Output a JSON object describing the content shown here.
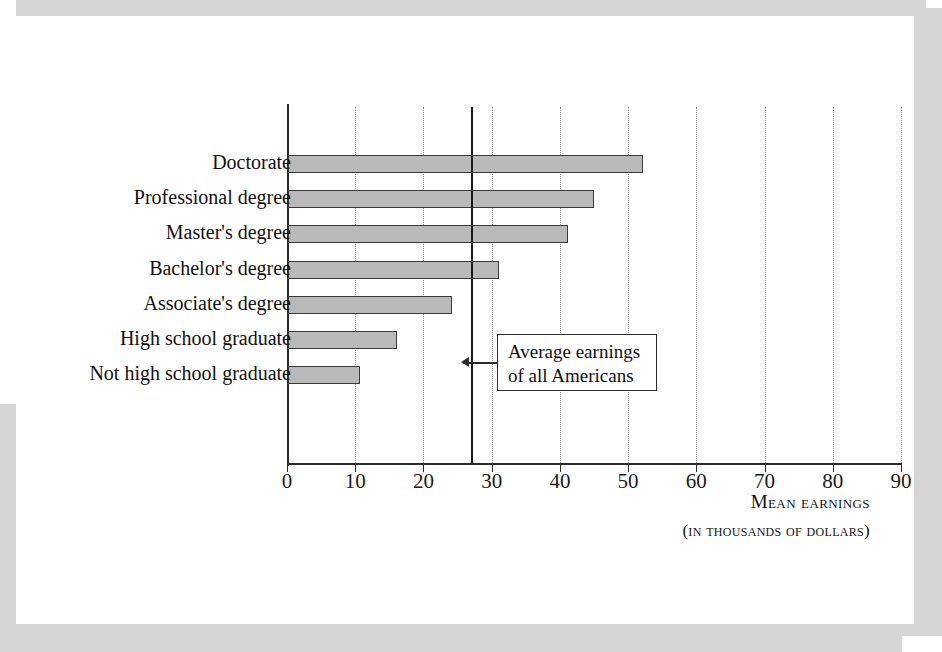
{
  "chart_data": {
    "type": "bar",
    "orientation": "horizontal",
    "title": "",
    "xlabel": "Mean earnings",
    "xlabel_sub": "(in thousands of dollars)",
    "ylabel": "",
    "xlim": [
      0,
      90
    ],
    "xticks": [
      0,
      10,
      20,
      30,
      40,
      50,
      60,
      70,
      80,
      90
    ],
    "xtick_labels": [
      "0",
      "10",
      "20",
      "30",
      "40",
      "50",
      "60",
      "70",
      "80",
      "90"
    ],
    "grid": "vertical-dotted",
    "legend": "none",
    "categories": [
      "Doctorate",
      "Professional degree",
      "Master's degree",
      "Bachelor's degree",
      "Associate's degree",
      "High school graduate",
      "Not high school graduate"
    ],
    "values": [
      52.0,
      44.8,
      41.0,
      31.0,
      24.0,
      16.0,
      10.5
    ],
    "bar_fill": "#b9b9b9",
    "bar_edge": "#3a3a3a",
    "annotations": [
      {
        "name": "average-earnings-reference",
        "value": 27.0,
        "line_color": "#1a1a1a",
        "text_line_1": "Average earnings",
        "text_line_2": "of all Americans"
      }
    ]
  },
  "page": {
    "frame_color": "#d5d5d5",
    "background": "#ffffff"
  }
}
